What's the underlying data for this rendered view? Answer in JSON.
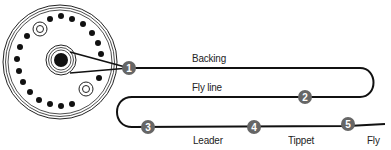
{
  "diagram": {
    "colors": {
      "line": "#111111",
      "marker": "#666666",
      "marker_text": "#ffffff",
      "label": "#222222"
    },
    "labels": {
      "backing": "Backing",
      "fly_line": "Fly line",
      "leader": "Leader",
      "tippet": "Tippet",
      "fly": "Fly"
    },
    "markers": [
      {
        "number": "1"
      },
      {
        "number": "2"
      },
      {
        "number": "3"
      },
      {
        "number": "4"
      },
      {
        "number": "5"
      }
    ],
    "reel": {
      "icon": "fly-reel-icon"
    }
  }
}
